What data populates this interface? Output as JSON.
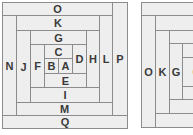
{
  "colors": {
    "fill": "#eeeeee",
    "line": "#8c8c8c",
    "text": "#3a3a3a",
    "background": "#ffffff"
  },
  "left_diagram": {
    "cells": [
      {
        "label": "O",
        "x": 2,
        "y": 2,
        "w": 111,
        "h": 14
      },
      {
        "label": "P",
        "x": 112,
        "y": 2,
        "w": 16,
        "h": 114
      },
      {
        "label": "N",
        "x": 2,
        "y": 15,
        "w": 15,
        "h": 101
      },
      {
        "label": "K",
        "x": 16,
        "y": 15,
        "w": 84,
        "h": 16
      },
      {
        "label": "L",
        "x": 99,
        "y": 15,
        "w": 14,
        "h": 88
      },
      {
        "label": "J",
        "x": 16,
        "y": 30,
        "w": 15,
        "h": 73
      },
      {
        "label": "G",
        "x": 30,
        "y": 30,
        "w": 57,
        "h": 15
      },
      {
        "label": "H",
        "x": 86,
        "y": 30,
        "w": 14,
        "h": 58
      },
      {
        "label": "F",
        "x": 30,
        "y": 44,
        "w": 15,
        "h": 44
      },
      {
        "label": "C",
        "x": 44,
        "y": 44,
        "w": 29,
        "h": 15
      },
      {
        "label": "D",
        "x": 72,
        "y": 44,
        "w": 15,
        "h": 30
      },
      {
        "label": "B",
        "x": 44,
        "y": 58,
        "w": 15,
        "h": 16
      },
      {
        "label": "A",
        "x": 58,
        "y": 58,
        "w": 15,
        "h": 16
      },
      {
        "label": "E",
        "x": 44,
        "y": 73,
        "w": 43,
        "h": 15
      },
      {
        "label": "I",
        "x": 30,
        "y": 87,
        "w": 70,
        "h": 16
      },
      {
        "label": "M",
        "x": 16,
        "y": 102,
        "w": 97,
        "h": 14
      },
      {
        "label": "Q",
        "x": 2,
        "y": 115,
        "w": 126,
        "h": 14
      }
    ]
  },
  "right_diagram": {
    "cells": [
      {
        "label": "",
        "x": 141,
        "y": 2,
        "w": 70,
        "h": 14
      },
      {
        "label": "O",
        "x": 141,
        "y": 15,
        "w": 15,
        "h": 113
      },
      {
        "label": "",
        "x": 155,
        "y": 15,
        "w": 56,
        "h": 16
      },
      {
        "label": "K",
        "x": 155,
        "y": 30,
        "w": 15,
        "h": 84
      },
      {
        "label": "",
        "x": 155,
        "y": 113,
        "w": 56,
        "h": 15
      },
      {
        "label": "",
        "x": 169,
        "y": 30,
        "w": 42,
        "h": 14
      },
      {
        "label": "G",
        "x": 169,
        "y": 43,
        "w": 14,
        "h": 57
      },
      {
        "label": "",
        "x": 169,
        "y": 99,
        "w": 42,
        "h": 15
      },
      {
        "label": "",
        "x": 182,
        "y": 43,
        "w": 29,
        "h": 15
      },
      {
        "label": "C",
        "x": 182,
        "y": 57,
        "w": 29,
        "h": 30
      },
      {
        "label": "",
        "x": 182,
        "y": 86,
        "w": 29,
        "h": 14
      }
    ]
  }
}
